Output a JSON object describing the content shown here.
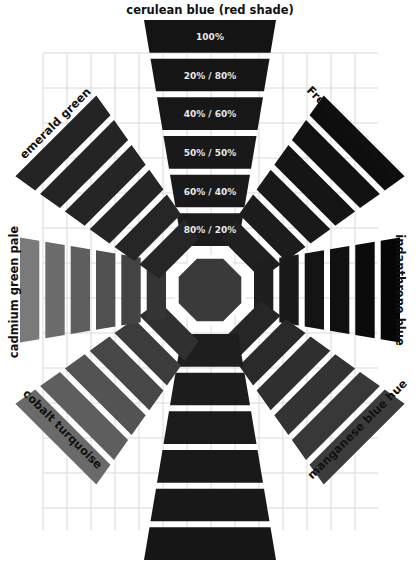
{
  "diagram": {
    "type": "radial-color-mixing-chart",
    "center": {
      "name": "cerulean blue (red shade)",
      "shape": "octagon",
      "color": "#3a3a3a"
    },
    "band_labels": [
      "100%",
      "20% / 80%",
      "40% / 60%",
      "50% / 50%",
      "60% / 40%",
      "80% / 20%"
    ],
    "pigments": [
      {
        "id": "top",
        "label": "cerulean blue (red shade)",
        "angle": -90,
        "color_outer": "#141414",
        "color_inner": "#1c1c1c"
      },
      {
        "id": "top-right",
        "label": "French ultramarine",
        "angle": -45,
        "color_outer": "#0e0e0e",
        "color_inner": "#202020"
      },
      {
        "id": "right",
        "label": "indanthrene blue",
        "angle": 0,
        "color_outer": "#060606",
        "color_inner": "#1e1e1e"
      },
      {
        "id": "bottom-right",
        "label": "manganese blue hue",
        "angle": 45,
        "color_outer": "#3c3c3c",
        "color_inner": "#262626"
      },
      {
        "id": "bottom",
        "label": "",
        "angle": 90,
        "color_outer": "#161616",
        "color_inner": "#1e1e1e"
      },
      {
        "id": "bottom-left",
        "label": "cobalt turquoise",
        "angle": 135,
        "color_outer": "#6a6a6a",
        "color_inner": "#303030"
      },
      {
        "id": "left",
        "label": "cadmium green pale",
        "angle": 180,
        "color_outer": "#7a7a7a",
        "color_inner": "#353535"
      },
      {
        "id": "top-left",
        "label": "emerald green",
        "angle": -135,
        "color_outer": "#242424",
        "color_inner": "#262626"
      }
    ],
    "grid": {
      "x0": 43,
      "y0": 53,
      "x1": 378,
      "y1": 530,
      "dx": 24,
      "dy": 35,
      "color": "#d9d9d9"
    }
  }
}
